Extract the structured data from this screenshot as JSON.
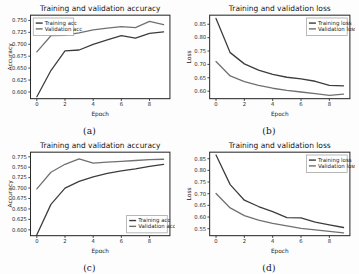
{
  "figure": {
    "subfigures": [
      "(a)",
      "(b)",
      "(c)",
      "(d)"
    ]
  },
  "chart_data": [
    {
      "id": "a",
      "type": "line",
      "title": "Training and validation accuracy",
      "xlabel": "Epoch",
      "ylabel": "Accuracy",
      "x": [
        0,
        1,
        2,
        3,
        4,
        5,
        6,
        7,
        8,
        9
      ],
      "xticks": [
        0,
        2,
        4,
        6,
        8
      ],
      "yticks": [
        0.6,
        0.625,
        0.65,
        0.675,
        0.7,
        0.725,
        0.75
      ],
      "ytick_labels": [
        "0.600",
        "0.625",
        "0.650",
        "0.675",
        "0.700",
        "0.725",
        "0.750"
      ],
      "xlim": [
        -0.45,
        9.45
      ],
      "ylim": [
        0.586,
        0.761
      ],
      "grid": false,
      "legend_position": "upper-left",
      "series": [
        {
          "name": "Training acc",
          "color": "#3c3c3c",
          "values": [
            0.59,
            0.645,
            0.686,
            0.688,
            0.7,
            0.709,
            0.718,
            0.713,
            0.723,
            0.726
          ]
        },
        {
          "name": "Validation acc",
          "color": "#707070",
          "values": [
            0.684,
            0.718,
            0.719,
            0.724,
            0.73,
            0.734,
            0.737,
            0.735,
            0.748,
            0.741
          ]
        }
      ]
    },
    {
      "id": "b",
      "type": "line",
      "title": "Training and validation loss",
      "xlabel": "Epoch",
      "ylabel": "Loss",
      "x": [
        0,
        1,
        2,
        3,
        4,
        5,
        6,
        7,
        8,
        9
      ],
      "xticks": [
        0,
        2,
        4,
        6,
        8
      ],
      "yticks": [
        0.6,
        0.65,
        0.7,
        0.75,
        0.8,
        0.85
      ],
      "ytick_labels": [
        "0.60",
        "0.65",
        "0.70",
        "0.75",
        "0.80",
        "0.85"
      ],
      "xlim": [
        -0.45,
        9.45
      ],
      "ylim": [
        0.572,
        0.884
      ],
      "grid": false,
      "legend_position": "upper-right",
      "series": [
        {
          "name": "Training loss",
          "color": "#3c3c3c",
          "values": [
            0.872,
            0.744,
            0.702,
            0.679,
            0.663,
            0.652,
            0.646,
            0.637,
            0.622,
            0.62
          ]
        },
        {
          "name": "Validation loss",
          "color": "#707070",
          "values": [
            0.711,
            0.657,
            0.636,
            0.622,
            0.611,
            0.603,
            0.597,
            0.591,
            0.584,
            0.589
          ]
        }
      ]
    },
    {
      "id": "c",
      "type": "line",
      "title": "Training and validation accuracy",
      "xlabel": "Epoch",
      "ylabel": "Accuracy",
      "x": [
        0,
        1,
        2,
        3,
        4,
        5,
        6,
        7,
        8,
        9
      ],
      "xticks": [
        0,
        2,
        4,
        6,
        8
      ],
      "yticks": [
        0.6,
        0.625,
        0.65,
        0.675,
        0.7,
        0.725,
        0.75,
        0.775
      ],
      "ytick_labels": [
        "0.600",
        "0.625",
        "0.650",
        "0.675",
        "0.700",
        "0.725",
        "0.750",
        "0.775"
      ],
      "xlim": [
        -0.45,
        9.45
      ],
      "ylim": [
        0.586,
        0.786
      ],
      "grid": false,
      "legend_position": "lower-right",
      "series": [
        {
          "name": "Training acc",
          "color": "#3c3c3c",
          "values": [
            0.588,
            0.661,
            0.7,
            0.716,
            0.727,
            0.735,
            0.741,
            0.746,
            0.752,
            0.757
          ]
        },
        {
          "name": "Validation acc",
          "color": "#707070",
          "values": [
            0.698,
            0.738,
            0.757,
            0.77,
            0.76,
            0.762,
            0.764,
            0.766,
            0.768,
            0.769
          ]
        }
      ]
    },
    {
      "id": "d",
      "type": "line",
      "title": "Training and validation loss",
      "xlabel": "Epoch",
      "ylabel": "Loss",
      "x": [
        0,
        1,
        2,
        3,
        4,
        5,
        6,
        7,
        8,
        9
      ],
      "xticks": [
        0,
        2,
        4,
        6,
        8
      ],
      "yticks": [
        0.55,
        0.6,
        0.65,
        0.7,
        0.75,
        0.8,
        0.85
      ],
      "ytick_labels": [
        "0.55",
        "0.60",
        "0.65",
        "0.70",
        "0.75",
        "0.80",
        "0.85"
      ],
      "xlim": [
        -0.45,
        9.45
      ],
      "ylim": [
        0.52,
        0.878
      ],
      "grid": false,
      "legend_position": "upper-right",
      "series": [
        {
          "name": "Training loss",
          "color": "#3c3c3c",
          "values": [
            0.866,
            0.739,
            0.672,
            0.645,
            0.623,
            0.597,
            0.596,
            0.578,
            0.566,
            0.555
          ]
        },
        {
          "name": "Validation loss",
          "color": "#707070",
          "values": [
            0.701,
            0.639,
            0.606,
            0.587,
            0.573,
            0.562,
            0.551,
            0.545,
            0.538,
            0.532
          ]
        }
      ]
    }
  ]
}
